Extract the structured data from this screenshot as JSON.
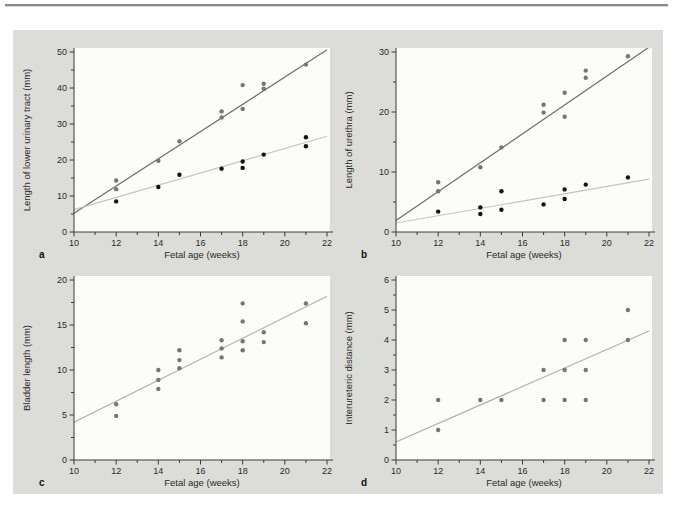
{
  "figure": {
    "caption_hint": "",
    "colors": {
      "panel_bg": "#dcdcd8",
      "plot_bg": "#fcfcfa",
      "axis": "#3a3a3a",
      "tick_label": "#2b2b2b",
      "top_rule": "#8a8a8a"
    }
  },
  "chart_data": [
    {
      "type": "scatter",
      "panel_label": "a",
      "xlabel": "Fetal age (weeks)",
      "ylabel": "Length of lower urinary tract (mm)",
      "xlim": [
        10,
        22
      ],
      "xticks": [
        10,
        12,
        14,
        16,
        18,
        20,
        22
      ],
      "x_minor_step": 1,
      "ylim": [
        0,
        50
      ],
      "yticks": [
        0,
        10,
        20,
        30,
        40,
        50
      ],
      "y_minor_step": 5,
      "grid": false,
      "legend": "none",
      "series": [
        {
          "name": "upper-series",
          "point_color": "#767676",
          "line_color": "#6f6f6f",
          "points": [
            [
              12,
              14.3
            ],
            [
              12,
              11.9
            ],
            [
              14,
              19.8
            ],
            [
              15,
              25.2
            ],
            [
              17,
              33.5
            ],
            [
              17,
              31.8
            ],
            [
              18,
              40.8
            ],
            [
              18,
              34.2
            ],
            [
              19,
              41.2
            ],
            [
              19,
              39.8
            ],
            [
              21,
              46.5
            ]
          ],
          "trend": [
            [
              10,
              5.2
            ],
            [
              22,
              50.6
            ]
          ]
        },
        {
          "name": "lower-series",
          "point_color": "#121212",
          "line_color": "#c4c4c2",
          "points": [
            [
              12,
              8.5
            ],
            [
              14,
              12.5
            ],
            [
              15,
              15.9
            ],
            [
              17,
              17.6
            ],
            [
              18,
              19.6
            ],
            [
              18,
              17.8
            ],
            [
              19,
              21.5
            ],
            [
              21,
              26.3
            ],
            [
              21,
              23.8
            ]
          ],
          "trend": [
            [
              10,
              6.2
            ],
            [
              22,
              26.6
            ]
          ]
        }
      ]
    },
    {
      "type": "scatter",
      "panel_label": "b",
      "xlabel": "Fetal age (weeks)",
      "ylabel": "Length of urethra (mm)",
      "xlim": [
        10,
        22
      ],
      "xticks": [
        10,
        12,
        14,
        16,
        18,
        20,
        22
      ],
      "x_minor_step": 1,
      "ylim": [
        0,
        30
      ],
      "yticks": [
        0,
        10,
        20,
        30
      ],
      "y_minor_step": 5,
      "grid": false,
      "legend": "none",
      "series": [
        {
          "name": "upper-series",
          "point_color": "#767676",
          "line_color": "#6f6f6f",
          "points": [
            [
              12,
              8.3
            ],
            [
              12,
              6.8
            ],
            [
              14,
              10.8
            ],
            [
              15,
              14.1
            ],
            [
              17,
              21.2
            ],
            [
              17,
              19.9
            ],
            [
              18,
              23.2
            ],
            [
              18,
              19.2
            ],
            [
              19,
              26.9
            ],
            [
              19,
              25.7
            ],
            [
              21,
              29.3
            ]
          ],
          "trend": [
            [
              10,
              1.9
            ],
            [
              22,
              30.8
            ]
          ]
        },
        {
          "name": "lower-series",
          "point_color": "#121212",
          "line_color": "#c4c4c2",
          "points": [
            [
              12,
              3.4
            ],
            [
              14,
              4.1
            ],
            [
              14,
              3.0
            ],
            [
              15,
              6.8
            ],
            [
              15,
              3.7
            ],
            [
              17,
              4.6
            ],
            [
              18,
              7.1
            ],
            [
              18,
              5.5
            ],
            [
              19,
              7.9
            ],
            [
              21,
              9.1
            ]
          ],
          "trend": [
            [
              10,
              1.5
            ],
            [
              22,
              8.8
            ]
          ]
        }
      ]
    },
    {
      "type": "scatter",
      "panel_label": "c",
      "xlabel": "Fetal age (weeks)",
      "ylabel": "Bladder length (mm)",
      "xlim": [
        10,
        22
      ],
      "xticks": [
        10,
        12,
        14,
        16,
        18,
        20,
        22
      ],
      "x_minor_step": 1,
      "ylim": [
        0,
        20
      ],
      "yticks": [
        0,
        5,
        10,
        15,
        20
      ],
      "y_minor_step": 2.5,
      "grid": false,
      "legend": "none",
      "series": [
        {
          "name": "single-series",
          "point_color": "#767676",
          "line_color": "#b2b2b0",
          "points": [
            [
              12,
              6.2
            ],
            [
              12,
              4.9
            ],
            [
              14,
              10.0
            ],
            [
              14,
              8.9
            ],
            [
              14,
              7.9
            ],
            [
              15,
              12.2
            ],
            [
              15,
              11.1
            ],
            [
              15,
              10.2
            ],
            [
              17,
              13.3
            ],
            [
              17,
              12.4
            ],
            [
              17,
              11.4
            ],
            [
              18,
              17.4
            ],
            [
              18,
              15.4
            ],
            [
              18,
              13.2
            ],
            [
              18,
              12.2
            ],
            [
              19,
              14.2
            ],
            [
              19,
              13.1
            ],
            [
              21,
              17.4
            ],
            [
              21,
              15.2
            ]
          ],
          "trend": [
            [
              10,
              4.2
            ],
            [
              22,
              18.2
            ]
          ]
        }
      ]
    },
    {
      "type": "scatter",
      "panel_label": "d",
      "xlabel": "Fetal age (weeks)",
      "ylabel": "Interureteric distance (mm)",
      "xlim": [
        10,
        22
      ],
      "xticks": [
        10,
        12,
        14,
        16,
        18,
        20,
        22
      ],
      "x_minor_step": 1,
      "ylim": [
        0,
        6
      ],
      "yticks": [
        0,
        1,
        2,
        3,
        4,
        5,
        6
      ],
      "y_minor_step": 0.5,
      "grid": false,
      "legend": "none",
      "series": [
        {
          "name": "single-series",
          "point_color": "#767676",
          "line_color": "#b2b2b0",
          "points": [
            [
              12,
              2
            ],
            [
              12,
              1
            ],
            [
              14,
              2
            ],
            [
              15,
              2
            ],
            [
              17,
              3
            ],
            [
              17,
              2
            ],
            [
              18,
              4
            ],
            [
              18,
              3
            ],
            [
              18,
              2
            ],
            [
              19,
              4
            ],
            [
              19,
              3
            ],
            [
              19,
              2
            ],
            [
              21,
              5
            ],
            [
              21,
              4
            ]
          ],
          "trend": [
            [
              10,
              0.6
            ],
            [
              22,
              4.3
            ]
          ]
        }
      ]
    }
  ]
}
